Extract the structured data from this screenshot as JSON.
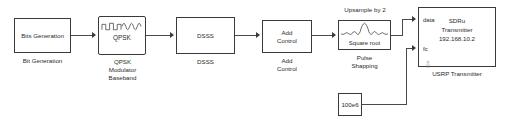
{
  "diagram": {
    "type": "simulink-block-diagram",
    "background": "#ffffff",
    "line_color": "#4a4a4a",
    "block_border_color": "#3a3a3a"
  },
  "blocks": {
    "bits_generation": {
      "inner_label": "Bits Generation",
      "caption": "Bit Generation"
    },
    "qpsk_modulator": {
      "inner_label": "QPSK",
      "icon": "square-to-sine-waveform-icon",
      "caption": "QPSK\nModulator\nBaseband"
    },
    "dsss": {
      "inner_label": "DSSS",
      "caption": "DSSS"
    },
    "add_control": {
      "inner_label": "Add\nControl",
      "caption": "Add\nControl"
    },
    "pulse_shaping": {
      "top_label": "Upsample by 2",
      "inner_label": "Square root",
      "icon": "raised-cosine-pulse-icon",
      "caption": "Pulse\nShapping"
    },
    "usrp_transmitter": {
      "inner_label": "SDRu\nTransmitter\n192.168.10.2",
      "caption": "USRP Transmitter",
      "ports": [
        {
          "name": "data",
          "label": "data"
        },
        {
          "name": "fc",
          "label": "fc"
        }
      ],
      "antenna_icon": "antenna-icon"
    },
    "constant_frequency": {
      "inner_label": "100e6"
    }
  },
  "connections": [
    {
      "from": "bits_generation",
      "to": "qpsk_modulator"
    },
    {
      "from": "qpsk_modulator",
      "to": "dsss"
    },
    {
      "from": "dsss",
      "to": "add_control"
    },
    {
      "from": "add_control",
      "to": "pulse_shaping"
    },
    {
      "from": "pulse_shaping",
      "to": "usrp_transmitter.data"
    },
    {
      "from": "constant_frequency",
      "to": "usrp_transmitter.fc"
    }
  ]
}
